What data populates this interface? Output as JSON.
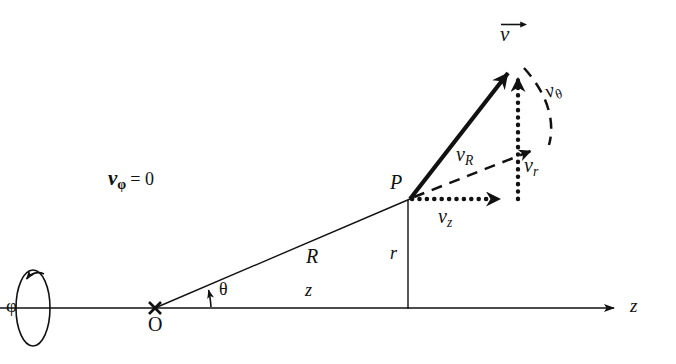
{
  "figure": {
    "background_color": "#ffffff",
    "line_color": "#111111",
    "width": 676,
    "height": 364
  },
  "labels": {
    "phi_axis": "φ",
    "origin": "O",
    "point_p": "P",
    "theta": "θ",
    "radius_R": "R",
    "radius_r": "r",
    "axial_z": "z",
    "axis_z": "z",
    "v_vector": "v",
    "v_phi_zero_symbol": "ν",
    "v_phi_zero_sub": "φ",
    "v_phi_zero_eq": "= 0",
    "v_R_symbol": "ν",
    "v_R_sub": "R",
    "v_r_symbol": "ν",
    "v_r_sub": "r",
    "v_z_symbol": "ν",
    "v_z_sub": "z",
    "v_theta_symbol": "ν",
    "v_theta_sub": "θ"
  },
  "geometry": {
    "origin_point": [
      155,
      308
    ],
    "point_p": [
      410,
      199
    ],
    "v_tip": [
      518,
      60
    ],
    "foot_of_r": [
      408,
      308
    ],
    "z_axis_start": [
      0,
      308
    ],
    "z_axis_end": [
      618,
      308
    ],
    "rotation_ellipse_center": [
      33,
      308
    ],
    "rotation_ellipse_rx": 17,
    "rotation_ellipse_ry": 38,
    "theta_degrees": 23
  },
  "icons": {
    "rotation_arrow": "curved-rotation-arrow-icon",
    "origin_cross": "cross-mark-icon",
    "z_axis_arrow": "arrowhead-right-icon",
    "velocity_arrow": "thick-vector-arrow-icon",
    "theta_arc_arrow": "angle-arc-arrow-icon"
  }
}
